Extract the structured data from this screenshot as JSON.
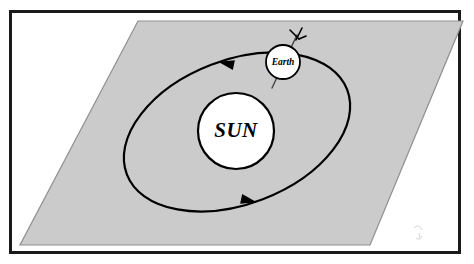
{
  "figure": {
    "type": "astronomy-schematic"
  },
  "frame": {
    "border_color": "#1a1a1a",
    "background_color": "#ffffff",
    "border_width_px": 3
  },
  "plane": {
    "name": "ecliptic-plane",
    "fill_color": "#cbcbcb",
    "edge_color": "#8f8f8f",
    "shape": "parallelogram",
    "points": "138,21 463,21 370,245 20,245"
  },
  "sun": {
    "label": "SUN",
    "center_x": 236,
    "center_y": 131,
    "radius": 38,
    "fill_color": "#ffffff",
    "stroke_color": "#000000"
  },
  "earth": {
    "label": "Earth",
    "center_x": 283,
    "center_y": 62,
    "radius": 17,
    "fill_color": "#ffffff",
    "stroke_color": "#000000",
    "axis": {
      "name": "rotation-axis",
      "tilt_note": "tilted axis with arrow at north pole",
      "top_x": 297,
      "top_y": 35,
      "bottom_x": 272,
      "bottom_y": 88
    }
  },
  "orbit": {
    "name": "orbital-ellipse",
    "center_x": 237,
    "center_y": 132,
    "semi_major_px": 118,
    "semi_minor_px": 72,
    "rotation_deg": -21,
    "stroke_color": "#000000",
    "stroke_width_px": 2.2,
    "direction": "counterclockwise",
    "arrow_top": {
      "label": "direction-arrow-top",
      "x": 229,
      "y": 64,
      "points_toward": "left"
    },
    "arrow_bottom": {
      "label": "direction-arrow-bottom",
      "x": 246,
      "y": 200,
      "points_toward": "right"
    }
  },
  "artifact": {
    "name": "scan-smudge",
    "x": 418,
    "y": 232
  }
}
